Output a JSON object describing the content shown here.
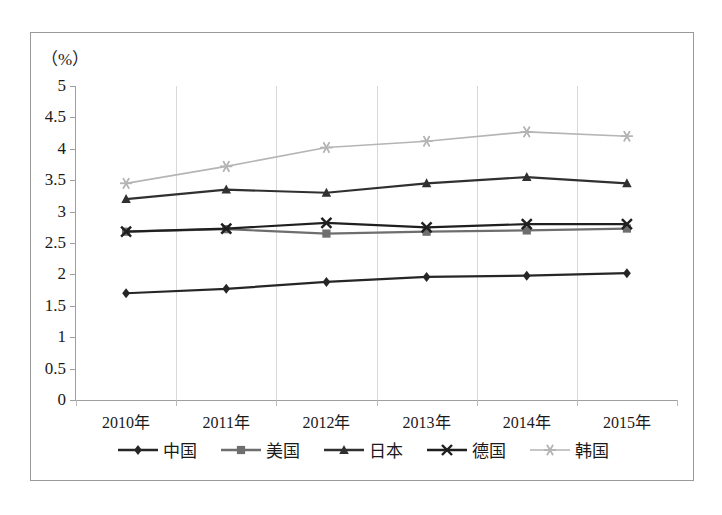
{
  "chart_data": {
    "type": "line",
    "title": "",
    "subtitle": "",
    "unit_label": "（%）",
    "xlabel": "",
    "ylabel": "",
    "ylim": [
      0,
      5
    ],
    "ytick_step": 0.5,
    "yticks": [
      "5",
      "4.5",
      "4",
      "3.5",
      "3",
      "2.5",
      "2",
      "1.5",
      "1",
      "0.5",
      "0"
    ],
    "ytick_values": [
      5,
      4.5,
      4,
      3.5,
      3,
      2.5,
      2,
      1.5,
      1,
      0.5,
      0
    ],
    "categories": [
      "2010年",
      "2011年",
      "2012年",
      "2013年",
      "2014年",
      "2015年"
    ],
    "grid": "vertical",
    "legend_position": "bottom",
    "series": [
      {
        "name": "中国",
        "marker": "diamond",
        "color": "#262626",
        "values": [
          1.7,
          1.77,
          1.88,
          1.96,
          1.98,
          2.02
        ]
      },
      {
        "name": "美国",
        "marker": "square",
        "color": "#6e6e6e",
        "values": [
          2.68,
          2.72,
          2.65,
          2.68,
          2.7,
          2.73
        ]
      },
      {
        "name": "日本",
        "marker": "triangle",
        "color": "#303030",
        "values": [
          3.2,
          3.35,
          3.3,
          3.45,
          3.55,
          3.45
        ]
      },
      {
        "name": "德国",
        "marker": "cross",
        "color": "#1f1f1f",
        "values": [
          2.68,
          2.73,
          2.82,
          2.75,
          2.8,
          2.8
        ]
      },
      {
        "name": "韩国",
        "marker": "asterisk",
        "color": "#b5b5b5",
        "values": [
          3.45,
          3.72,
          4.02,
          4.12,
          4.27,
          4.2
        ]
      }
    ]
  },
  "frame": {
    "border_color": "#9a9a9a",
    "background": "#ffffff"
  }
}
